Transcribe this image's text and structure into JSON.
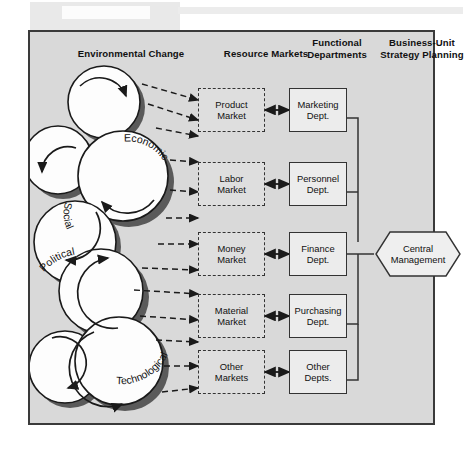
{
  "figure": {
    "headers": [
      {
        "id": "environmental-change",
        "text": "Environmental Change",
        "lines": [
          "Environmental Change"
        ]
      },
      {
        "id": "resource-markets",
        "text": "Resource Markets",
        "lines": [
          "Resource Markets"
        ]
      },
      {
        "id": "functional-departments",
        "text": "Functional Departments",
        "lines": [
          "Functional",
          "Departments"
        ]
      },
      {
        "id": "business-unit-strategy-planning",
        "text": "Business-Unit Strategy Planning",
        "lines": [
          "Business-Unit",
          "Strategy Planning"
        ]
      }
    ],
    "environment_circles": [
      {
        "id": "circle-unlabeled-top",
        "label": ""
      },
      {
        "id": "circle-unlabeled-upper-left",
        "label": ""
      },
      {
        "id": "circle-economic",
        "label": "Economic"
      },
      {
        "id": "circle-social",
        "label": "Social"
      },
      {
        "id": "circle-political",
        "label": "Political"
      },
      {
        "id": "circle-unlabeled-lower-left",
        "label": ""
      },
      {
        "id": "circle-technological",
        "label": "Technological"
      }
    ],
    "rows": [
      {
        "market": {
          "id": "product-market",
          "lines": [
            "Product",
            "Market"
          ]
        },
        "dept": {
          "id": "marketing-dept",
          "lines": [
            "Marketing",
            "Dept."
          ]
        }
      },
      {
        "market": {
          "id": "labor-market",
          "lines": [
            "Labor",
            "Market"
          ]
        },
        "dept": {
          "id": "personnel-dept",
          "lines": [
            "Personnel",
            "Dept."
          ]
        }
      },
      {
        "market": {
          "id": "money-market",
          "lines": [
            "Money",
            "Market"
          ]
        },
        "dept": {
          "id": "finance-dept",
          "lines": [
            "Finance",
            "Dept."
          ]
        }
      },
      {
        "market": {
          "id": "material-market",
          "lines": [
            "Material",
            "Market"
          ]
        },
        "dept": {
          "id": "purchasing-dept",
          "lines": [
            "Purchasing",
            "Dept."
          ]
        }
      },
      {
        "market": {
          "id": "other-markets",
          "lines": [
            "Other",
            "Markets"
          ]
        },
        "dept": {
          "id": "other-depts",
          "lines": [
            "Other",
            "Depts."
          ]
        }
      }
    ],
    "central": {
      "id": "central-management",
      "lines": [
        "Central",
        "Management"
      ]
    },
    "colors": {
      "page_background": "#ffffff",
      "frame_background": "#d9d9d9",
      "frame_border": "#3a3a3a",
      "box_fill": "#ececec",
      "market_fill": "#dedede",
      "ink": "#1a1a1a",
      "circle_fill": "#fdfdfd",
      "circle_shadow": "#5a5a5a",
      "scan_strip": "#e9e9e9"
    }
  }
}
